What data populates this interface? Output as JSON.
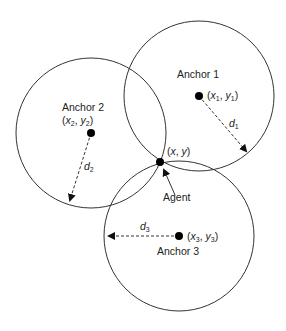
{
  "diagram": {
    "type": "trilateration",
    "anchors": [
      {
        "label": "Anchor 1",
        "coord_label": "(x1, y1)",
        "distance_label": "d1",
        "center": [
          199,
          96
        ],
        "radius": 75
      },
      {
        "label": "Anchor 2",
        "coord_label": "(x2, y2)",
        "distance_label": "d2",
        "center": [
          91,
          133
        ],
        "radius": 75
      },
      {
        "label": "Anchor 3",
        "coord_label": "(x3, y3)",
        "distance_label": "d3",
        "center": [
          179,
          236
        ],
        "radius": 75
      }
    ],
    "agent": {
      "label": "Agent",
      "coord_label": "(x, y)",
      "position": [
        160,
        162
      ]
    },
    "colors": {
      "stroke": "#333333",
      "dot": "#000000",
      "background": "#ffffff"
    }
  }
}
